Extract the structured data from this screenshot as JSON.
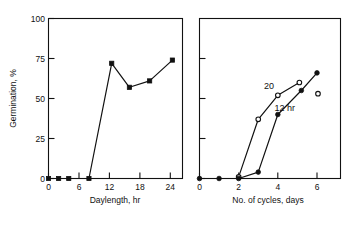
{
  "figure": {
    "panels": [
      "left",
      "right"
    ]
  },
  "chart_data": [
    {
      "panel": "left",
      "type": "line",
      "title": "",
      "xlabel": "Daylength, hr",
      "ylabel": "Germination, %",
      "xlim": [
        0,
        26.5
      ],
      "ylim": [
        0,
        100
      ],
      "xticks": [
        0,
        6,
        12,
        18,
        24
      ],
      "xticklabels": [
        "0",
        "6",
        "12",
        "18",
        "24"
      ],
      "yticks": [
        0,
        25,
        50,
        75,
        100
      ],
      "yticklabels": [
        "0",
        "25",
        "50",
        "75",
        "100"
      ],
      "grid": false,
      "legend": "none",
      "series": [
        {
          "name": "daylength-response",
          "marker": "filled-square",
          "x": [
            0,
            2,
            4,
            8,
            12.5,
            16,
            20,
            24.5
          ],
          "y": [
            0,
            0,
            0,
            0,
            72,
            57,
            61,
            74
          ]
        }
      ]
    },
    {
      "panel": "right",
      "type": "line",
      "title": "",
      "xlabel": "No. of cycles, days",
      "ylabel": "",
      "xlim": [
        0,
        7.2
      ],
      "ylim": [
        0,
        100
      ],
      "xticks": [
        0,
        2,
        4,
        6
      ],
      "xticklabels": [
        "0",
        "2",
        "4",
        "6"
      ],
      "yticks": [
        0,
        25,
        50,
        75,
        100
      ],
      "yticklabels": [
        "",
        "",
        "",
        "",
        ""
      ],
      "grid": false,
      "legend": "inline-annotations",
      "annotations": [
        {
          "text": "20",
          "x": 3.55,
          "y": 56
        },
        {
          "text": "12 hr",
          "x": 4.35,
          "y": 42
        }
      ],
      "series": [
        {
          "name": "20",
          "marker": "open-circle",
          "x": [
            2,
            3,
            4,
            5.1
          ],
          "y": [
            1,
            37,
            52,
            60
          ]
        },
        {
          "name": "12 hr",
          "marker": "filled-circle",
          "x": [
            0,
            1,
            2,
            3,
            4,
            5.2,
            6
          ],
          "y": [
            0,
            0,
            0,
            4,
            40,
            55,
            66
          ]
        },
        {
          "name": "20-extra-point",
          "marker": "open-circle",
          "x": [
            6.05
          ],
          "y": [
            53
          ]
        }
      ]
    }
  ],
  "colors": {
    "ink": "#111111",
    "background": "#ffffff"
  }
}
